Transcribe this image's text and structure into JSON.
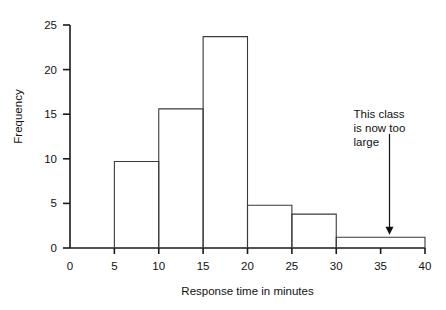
{
  "chart_data": {
    "type": "bar",
    "title": "",
    "subtitle": "",
    "xlabel": "Response time in minutes",
    "ylabel": "Frequency",
    "xlim": [
      0,
      40
    ],
    "ylim": [
      0,
      25
    ],
    "grid": false,
    "legend": null,
    "xticks": [
      "0",
      "5",
      "10",
      "15",
      "20",
      "25",
      "30",
      "35",
      "40"
    ],
    "xtick_values": [
      0,
      5,
      10,
      15,
      20,
      25,
      30,
      35,
      40
    ],
    "yticks": [
      "0",
      "5",
      "10",
      "15",
      "20",
      "25"
    ],
    "ytick_values": [
      0,
      5,
      10,
      15,
      20,
      25
    ],
    "bin_edges": [
      5,
      10,
      15,
      20,
      25,
      30,
      40
    ],
    "bins": [
      {
        "start": 5,
        "end": 10,
        "value": 9.7
      },
      {
        "start": 10,
        "end": 15,
        "value": 15.6
      },
      {
        "start": 15,
        "end": 20,
        "value": 23.7
      },
      {
        "start": 20,
        "end": 25,
        "value": 4.8
      },
      {
        "start": 25,
        "end": 30,
        "value": 3.8
      },
      {
        "start": 30,
        "end": 40,
        "value": 1.2
      }
    ],
    "categories": [
      "5-10",
      "10-15",
      "15-20",
      "20-25",
      "25-30",
      "30-40"
    ],
    "values": [
      9.7,
      15.6,
      23.7,
      4.8,
      3.8,
      1.2
    ],
    "annotations": [
      {
        "lines": [
          "This class",
          "is now too",
          "large"
        ],
        "arrow": {
          "from_x": 36,
          "from_y": 12.8,
          "to_x": 36,
          "to_y": 1.6
        },
        "target_bin": "30-40"
      }
    ],
    "colors": {
      "axis": "#1a1a1a",
      "bar_stroke": "#3a3a3a",
      "bar_fill": "none",
      "text": "#111111",
      "background": "#ffffff"
    }
  }
}
